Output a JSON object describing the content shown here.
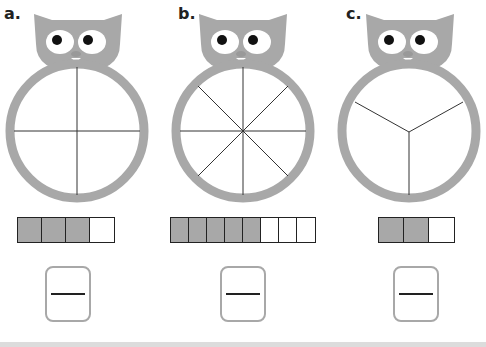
{
  "colors": {
    "cat_gray": "#a8a8a8",
    "line": "#333333",
    "fill": "#a8a8a8",
    "band": "#dcdcdc"
  },
  "problems": [
    {
      "label": "a.",
      "circle_parts": 4,
      "bar": {
        "total": 4,
        "shaded": 3
      },
      "fraction": {
        "numerator": "",
        "denominator": ""
      }
    },
    {
      "label": "b.",
      "circle_parts": 8,
      "bar": {
        "total": 8,
        "shaded": 5
      },
      "fraction": {
        "numerator": "",
        "denominator": ""
      }
    },
    {
      "label": "c.",
      "circle_parts": 3,
      "bar": {
        "total": 3,
        "shaded": 2
      },
      "fraction": {
        "numerator": "",
        "denominator": ""
      }
    }
  ]
}
